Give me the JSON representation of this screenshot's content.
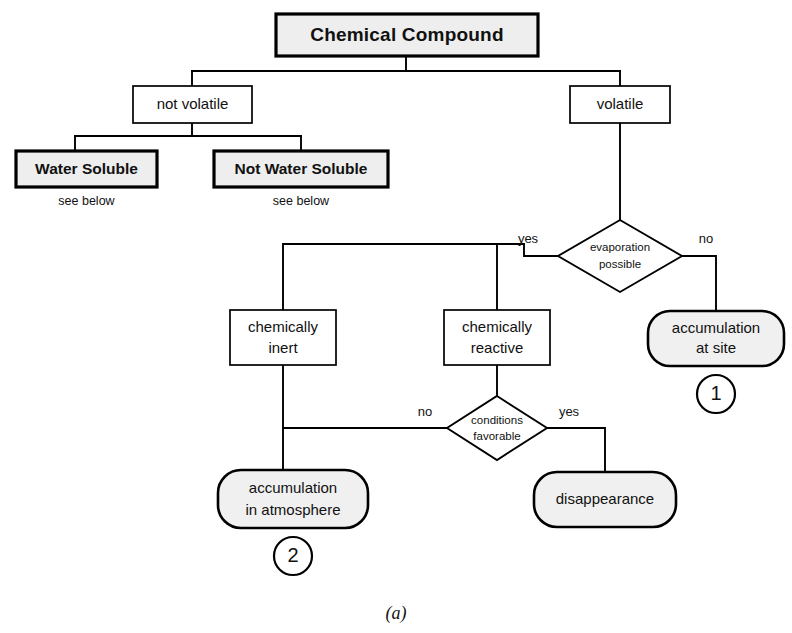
{
  "figure": {
    "caption": "(a)",
    "kind": "flowchart"
  },
  "nodes": {
    "root": {
      "label": "Chemical Compound",
      "shape": "box-strong"
    },
    "not_volatile": {
      "label": "not volatile",
      "shape": "box-plain"
    },
    "volatile": {
      "label": "volatile",
      "shape": "box-plain"
    },
    "water_soluble": {
      "label": "Water Soluble",
      "shape": "box-strong",
      "note": "see below"
    },
    "not_water_soluble": {
      "label": "Not Water Soluble",
      "shape": "box-strong",
      "note": "see below"
    },
    "evaporation": {
      "label_line1": "evaporation",
      "label_line2": "possible",
      "shape": "diamond"
    },
    "accumulation_site": {
      "label_line1": "accumulation",
      "label_line2": "at site",
      "shape": "rounded",
      "badge": "1"
    },
    "chem_inert": {
      "label_line1": "chemically",
      "label_line2": "inert",
      "shape": "box-plain"
    },
    "chem_reactive": {
      "label_line1": "chemically",
      "label_line2": "reactive",
      "shape": "box-plain"
    },
    "conditions": {
      "label_line1": "conditions",
      "label_line2": "favorable",
      "shape": "diamond"
    },
    "accumulation_atmosphere": {
      "label_line1": "accumulation",
      "label_line2": "in atmosphere",
      "shape": "rounded",
      "badge": "2"
    },
    "disappearance": {
      "label": "disappearance",
      "shape": "rounded"
    }
  },
  "edge_labels": {
    "evaporation_yes": "yes",
    "evaporation_no": "no",
    "conditions_no": "no",
    "conditions_yes": "yes"
  },
  "colors": {
    "stroke": "#000000",
    "fill_strong": "#eeeeee",
    "fill_round": "#f0f0f0",
    "fill_plain": "#ffffff",
    "background": "#ffffff"
  }
}
